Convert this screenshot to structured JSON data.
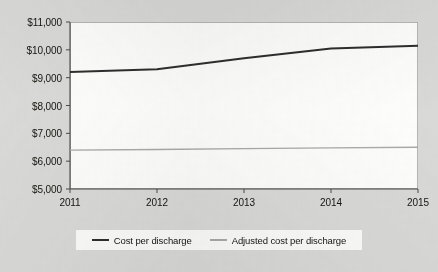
{
  "chart_data": {
    "type": "line",
    "title": "",
    "subtitle": "",
    "xlabel": "",
    "ylabel": "",
    "categories": [
      "2011",
      "2012",
      "2013",
      "2014",
      "2015"
    ],
    "x": [
      2011,
      2012,
      2013,
      2014,
      2015
    ],
    "series": [
      {
        "name": "Cost per discharge",
        "color": "#2e2e2e",
        "values": [
          9200,
          9300,
          9700,
          10050,
          10150
        ]
      },
      {
        "name": "Adjusted cost per discharge",
        "color": "#a9a9a7",
        "values": [
          6400,
          6420,
          6450,
          6480,
          6500
        ]
      }
    ],
    "ylim": [
      5000,
      11000
    ],
    "yticks": [
      5000,
      6000,
      7000,
      8000,
      9000,
      10000,
      11000
    ],
    "ytick_labels": [
      "$5,000",
      "$6,000",
      "$7,000",
      "$8,000",
      "$9,000",
      "$10,000",
      "$11,000"
    ],
    "xtick_labels": [
      "2011",
      "2012",
      "2013",
      "2014",
      "2015"
    ],
    "grid": false,
    "legend_position": "bottom"
  },
  "axes": {
    "y_labels": [
      {
        "text": "$11,000",
        "value": 11000
      },
      {
        "text": "$10,000",
        "value": 10000
      },
      {
        "text": "$9,000",
        "value": 9000
      },
      {
        "text": "$8,000",
        "value": 8000
      },
      {
        "text": "$7,000",
        "value": 7000
      },
      {
        "text": "$6,000",
        "value": 6000
      },
      {
        "text": "$5,000",
        "value": 5000
      }
    ],
    "x_labels": [
      {
        "text": "2011",
        "value": 2011
      },
      {
        "text": "2012",
        "value": 2012
      },
      {
        "text": "2013",
        "value": 2013
      },
      {
        "text": "2014",
        "value": 2014
      },
      {
        "text": "2015",
        "value": 2015
      }
    ]
  },
  "legend": {
    "items": [
      {
        "label": "Cost per discharge",
        "color": "#2e2e2e"
      },
      {
        "label": "Adjusted cost per discharge",
        "color": "#a9a9a7"
      }
    ]
  },
  "colors": {
    "background": "#d9d9d7",
    "plot_background": "#fdfdfc",
    "axis": "#4a4a48",
    "frame": "#b6b6b4",
    "series_primary": "#2e2e2e",
    "series_secondary": "#a9a9a7",
    "text": "#15140f"
  }
}
